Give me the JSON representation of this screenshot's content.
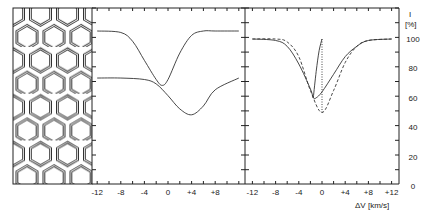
{
  "chart_data": [
    {
      "type": "line",
      "title": "Middle panel: line profiles",
      "xlabel": "",
      "ylabel": "",
      "x_ticks": [
        "-12",
        "-8",
        "-4",
        "0",
        "+4",
        "+8"
      ],
      "xlim": [
        -12,
        12
      ],
      "series": [
        {
          "name": "profile-upper",
          "x": [
            -12,
            -8,
            -6,
            -4,
            -2,
            -1,
            0,
            2,
            4,
            6,
            8,
            12
          ],
          "y": [
            100,
            99,
            93,
            80,
            67,
            63,
            67,
            85,
            97,
            100,
            100,
            100
          ]
        },
        {
          "name": "profile-lower",
          "x": [
            -12,
            -8,
            -4,
            -2,
            0,
            2,
            4,
            6,
            8,
            12
          ],
          "y": [
            68,
            68,
            67,
            64,
            56,
            47,
            43,
            49,
            60,
            68
          ]
        }
      ]
    },
    {
      "type": "line",
      "title": "Right panel: line profiles",
      "xlabel": "ΔV [km/s]",
      "ylabel": "I [%]",
      "x_ticks": [
        "-12",
        "-8",
        "-4",
        "0",
        "+4",
        "+8",
        "+12"
      ],
      "y_ticks": [
        "0",
        "20",
        "40",
        "60",
        "80",
        "100"
      ],
      "xlim": [
        -12,
        12
      ],
      "ylim": [
        0,
        100
      ],
      "series": [
        {
          "name": "solid",
          "x": [
            -12,
            -8,
            -6,
            -4,
            -2,
            -1.5,
            -1,
            0,
            2,
            4,
            6,
            8,
            12
          ],
          "y": [
            100,
            99,
            95,
            83,
            66,
            60,
            60,
            64,
            76,
            88,
            95,
            99,
            100
          ]
        },
        {
          "name": "solid-branch",
          "x": [
            -1.5,
            -1,
            -0.5,
            0
          ],
          "y": [
            60,
            78,
            92,
            100
          ]
        },
        {
          "name": "dashed",
          "x": [
            -12,
            -8,
            -6,
            -4,
            -2,
            0,
            2,
            4,
            6,
            8,
            12
          ],
          "y": [
            100,
            100,
            98,
            88,
            65,
            50,
            65,
            84,
            95,
            99,
            100
          ]
        },
        {
          "name": "dotted",
          "x": [
            0,
            0
          ],
          "y": [
            50,
            100
          ]
        }
      ]
    }
  ],
  "axes": {
    "y_title": "I",
    "y_unit": "[%]",
    "y_labels": [
      "100",
      "80",
      "60",
      "40",
      "20",
      "0"
    ],
    "x_labels_middle": [
      "-12",
      "-8",
      "-4",
      "0",
      "+4",
      "+8"
    ],
    "x_labels_right": [
      "-12",
      "-8",
      "-4",
      "0",
      "+4",
      "+8",
      "+12"
    ],
    "x_title": "ΔV [km/s]"
  },
  "illustration": {
    "name": "hexagonal-cell-pattern"
  }
}
